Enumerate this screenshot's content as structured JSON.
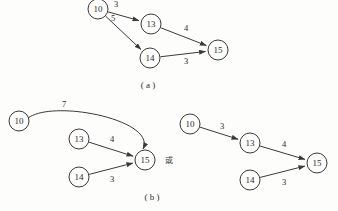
{
  "figure": {
    "background_color": "#fdfdfc",
    "ink_color": "#3a3a3a",
    "panels": [
      {
        "id": "a",
        "caption": "( a )",
        "caption_x": 148,
        "caption_y": 86,
        "graphs": [
          {
            "id": "a-main",
            "nodes": [
              {
                "id": "n10",
                "label": "10",
                "cx": 98,
                "cy": 9,
                "r": 10
              },
              {
                "id": "n13",
                "label": "13",
                "cx": 151,
                "cy": 24,
                "r": 10
              },
              {
                "id": "n14",
                "label": "14",
                "cx": 150,
                "cy": 58,
                "r": 10
              },
              {
                "id": "n15",
                "label": "15",
                "cx": 218,
                "cy": 50,
                "r": 10
              }
            ],
            "edges": [
              {
                "id": "a-10-13",
                "from": "n10",
                "to": "n13",
                "weight": "3",
                "label_x": 116,
                "label_y": 5,
                "curved": false
              },
              {
                "id": "a-10-14",
                "from": "n10",
                "to": "n14",
                "weight": "5",
                "label_x": 113,
                "label_y": 19,
                "curved": false
              },
              {
                "id": "a-13-15",
                "from": "n13",
                "to": "n15",
                "weight": "4",
                "label_x": 186,
                "label_y": 29,
                "curved": false
              },
              {
                "id": "a-14-15",
                "from": "n14",
                "to": "n15",
                "weight": "3",
                "label_x": 186,
                "label_y": 62,
                "curved": false
              }
            ]
          }
        ]
      },
      {
        "id": "b",
        "caption": "( b )",
        "caption_x": 152,
        "caption_y": 198,
        "conjunction": {
          "text": "或",
          "x": 169,
          "y": 161
        },
        "graphs": [
          {
            "id": "b-left",
            "nodes": [
              {
                "id": "n10",
                "label": "10",
                "cx": 19,
                "cy": 121,
                "r": 10
              },
              {
                "id": "n13",
                "label": "13",
                "cx": 79,
                "cy": 139,
                "r": 10
              },
              {
                "id": "n14",
                "label": "14",
                "cx": 79,
                "cy": 177,
                "r": 10
              },
              {
                "id": "n15",
                "label": "15",
                "cx": 145,
                "cy": 160,
                "r": 10
              }
            ],
            "edges": [
              {
                "id": "b-10-15",
                "from": "n10",
                "to": "n15",
                "weight": "7",
                "label_x": 64,
                "label_y": 105,
                "curved": true
              },
              {
                "id": "b-13-15",
                "from": "n13",
                "to": "n15",
                "weight": "4",
                "label_x": 112,
                "label_y": 140,
                "curved": false
              },
              {
                "id": "b-14-15",
                "from": "n14",
                "to": "n15",
                "weight": "3",
                "label_x": 112,
                "label_y": 180,
                "curved": false
              }
            ]
          },
          {
            "id": "b-right",
            "nodes": [
              {
                "id": "n10",
                "label": "10",
                "cx": 190,
                "cy": 124,
                "r": 10
              },
              {
                "id": "n13",
                "label": "13",
                "cx": 250,
                "cy": 143,
                "r": 10
              },
              {
                "id": "n14",
                "label": "14",
                "cx": 250,
                "cy": 180,
                "r": 10
              },
              {
                "id": "n15",
                "label": "15",
                "cx": 317,
                "cy": 163,
                "r": 10
              }
            ],
            "edges": [
              {
                "id": "br-10-13",
                "from": "n10",
                "to": "n13",
                "weight": "3",
                "label_x": 222,
                "label_y": 127,
                "curved": false
              },
              {
                "id": "br-13-15",
                "from": "n13",
                "to": "n15",
                "weight": "4",
                "label_x": 284,
                "label_y": 145,
                "curved": false
              },
              {
                "id": "br-14-15",
                "from": "n14",
                "to": "n15",
                "weight": "3",
                "label_x": 284,
                "label_y": 183,
                "curved": false
              }
            ]
          }
        ]
      }
    ]
  }
}
